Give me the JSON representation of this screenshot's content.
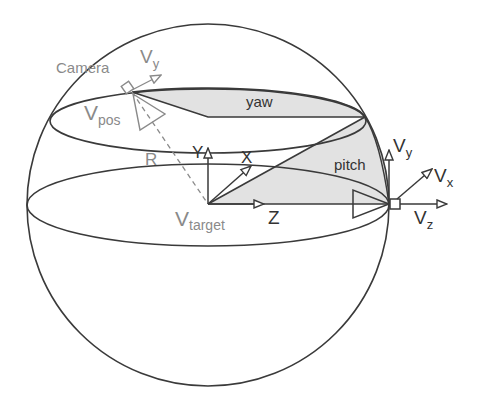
{
  "diagram": {
    "colors": {
      "line": "#3a3a3a",
      "camera": "#8a8a8a",
      "fill": "#e2e2e2",
      "text_dark": "#333333",
      "text_grey": "#8a8a8a",
      "background": "#ffffff"
    },
    "labels": {
      "camera": "Camera",
      "cam_vy_main": "V",
      "cam_vy_sub": "y",
      "vpos_main": "V",
      "vpos_sub": "pos",
      "radius": "R",
      "yaw": "yaw",
      "pitch": "pitch",
      "axis_y": "Y",
      "axis_x": "X",
      "axis_z": "Z",
      "vtarget_main": "V",
      "vtarget_sub": "target",
      "tgt_vy_main": "V",
      "tgt_vy_sub": "y",
      "tgt_vx_main": "V",
      "tgt_vx_sub": "x",
      "tgt_vz_main": "V",
      "tgt_vz_sub": "z"
    },
    "shapes": [
      {
        "name": "sphere",
        "type": "circle",
        "cx": 208,
        "cy": 205,
        "r": 181
      },
      {
        "name": "upper-latitude-ellipse",
        "type": "ellipse",
        "cx": 208,
        "cy": 121,
        "rx": 158,
        "ry": 32
      },
      {
        "name": "equator-ellipse",
        "type": "ellipse",
        "cx": 208,
        "cy": 205,
        "rx": 181,
        "ry": 41
      }
    ],
    "points": {
      "camera": [
        132,
        92
      ],
      "target": [
        208,
        204
      ],
      "upper_center": [
        208,
        117
      ],
      "yaw_edge": [
        365,
        117
      ],
      "equator_right": [
        389,
        204
      ]
    }
  }
}
